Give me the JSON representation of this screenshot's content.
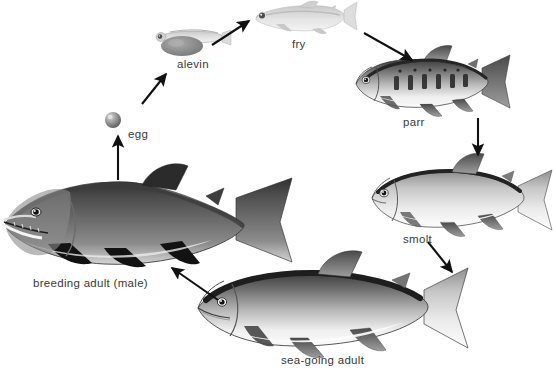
{
  "diagram": {
    "background_color": "#ffffff",
    "label_color": "#3a3a3a",
    "arrow_color": "#111111",
    "stages": [
      {
        "id": "egg",
        "label": "egg",
        "order": 1,
        "label_x": 128,
        "label_y": 128,
        "figure": "sphere",
        "figure_x": 113,
        "figure_y": 120,
        "figure_w": 16,
        "figure_h": 16
      },
      {
        "id": "alevin",
        "label": "alevin",
        "order": 2,
        "label_x": 177,
        "label_y": 58,
        "figure": "fish",
        "figure_x": 155,
        "figure_y": 26,
        "figure_w": 70,
        "figure_h": 28
      },
      {
        "id": "fry",
        "label": "fry",
        "order": 3,
        "label_x": 292,
        "label_y": 38,
        "figure": "fish",
        "figure_x": 252,
        "figure_y": 4,
        "figure_w": 98,
        "figure_h": 30
      },
      {
        "id": "parr",
        "label": "parr",
        "order": 4,
        "label_x": 403,
        "label_y": 116,
        "figure": "fish",
        "figure_x": 350,
        "figure_y": 52,
        "figure_w": 160,
        "figure_h": 60
      },
      {
        "id": "smolt",
        "label": "smolt",
        "order": 5,
        "label_x": 403,
        "label_y": 233,
        "figure": "fish",
        "figure_x": 367,
        "figure_y": 166,
        "figure_w": 186,
        "figure_h": 68
      },
      {
        "id": "sea-going-adult",
        "label": "sea-going adult",
        "order": 6,
        "label_x": 281,
        "label_y": 354,
        "figure": "fish",
        "figure_x": 193,
        "figure_y": 270,
        "figure_w": 275,
        "figure_h": 84
      },
      {
        "id": "breeding-adult-male",
        "label": "breeding adult (male)",
        "order": 7,
        "label_x": 33,
        "label_y": 277,
        "figure": "fish",
        "figure_x": 2,
        "figure_y": 173,
        "figure_w": 296,
        "figure_h": 98
      }
    ],
    "arrows": [
      {
        "id": "arrow-breeding-to-egg",
        "from": "breeding-adult-male",
        "to": "egg",
        "x1": 118,
        "y1": 180,
        "x2": 118,
        "y2": 136
      },
      {
        "id": "arrow-egg-to-alevin",
        "from": "egg",
        "to": "alevin",
        "x1": 142,
        "y1": 104,
        "x2": 166,
        "y2": 74
      },
      {
        "id": "arrow-alevin-to-fry",
        "from": "alevin",
        "to": "fry",
        "x1": 212,
        "y1": 45,
        "x2": 249,
        "y2": 21
      },
      {
        "id": "arrow-fry-to-parr",
        "from": "fry",
        "to": "parr",
        "x1": 364,
        "y1": 33,
        "x2": 412,
        "y2": 60
      },
      {
        "id": "arrow-parr-to-smolt",
        "from": "parr",
        "to": "smolt",
        "x1": 478,
        "y1": 118,
        "x2": 478,
        "y2": 155
      },
      {
        "id": "arrow-smolt-to-sea",
        "from": "smolt",
        "to": "sea-going-adult",
        "x1": 428,
        "y1": 242,
        "x2": 452,
        "y2": 272
      },
      {
        "id": "arrow-sea-to-breeding",
        "from": "sea-going-adult",
        "to": "breeding-adult-male",
        "x1": 218,
        "y1": 300,
        "x2": 172,
        "y2": 268
      }
    ]
  }
}
